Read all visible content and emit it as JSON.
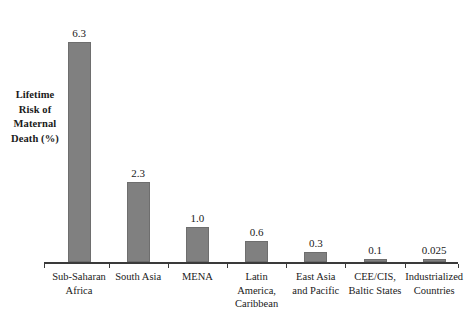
{
  "chart_data": {
    "type": "bar",
    "title": "",
    "subtitle": "",
    "xlabel": "",
    "ylabel": "Lifetime Risk of Maternal Death (%)",
    "ylim": [
      0,
      6.3
    ],
    "grid": false,
    "legend": "none",
    "bar_color": "#808080",
    "bar_border_color": "#6e6e6e",
    "axis_color": "#3a3a3a",
    "categories": [
      "Sub-Saharan Africa",
      "South Asia",
      "MENA",
      "Latin America, Caribbean",
      "East Asia and Pacific",
      "CEE/CIS, Baltic States",
      "Industrialized Countries"
    ],
    "values": [
      6.3,
      2.3,
      1.0,
      0.6,
      0.3,
      0.1,
      0.025
    ],
    "value_labels": [
      "6.3",
      "2.3",
      "1.0",
      "0.6",
      "0.3",
      "0.1",
      "0.025"
    ]
  },
  "y_axis_caption": {
    "lines": [
      "Lifetime",
      "Risk of",
      "Maternal",
      "Death (%)"
    ]
  },
  "category_label_lines": [
    [
      "Sub-Saharan",
      "Africa"
    ],
    [
      "South Asia"
    ],
    [
      "MENA"
    ],
    [
      "Latin",
      "America,",
      "Caribbean"
    ],
    [
      "East Asia",
      "and Pacific"
    ],
    [
      "CEE/CIS,",
      "Baltic States"
    ],
    [
      "Industrialized",
      "Countries"
    ]
  ]
}
